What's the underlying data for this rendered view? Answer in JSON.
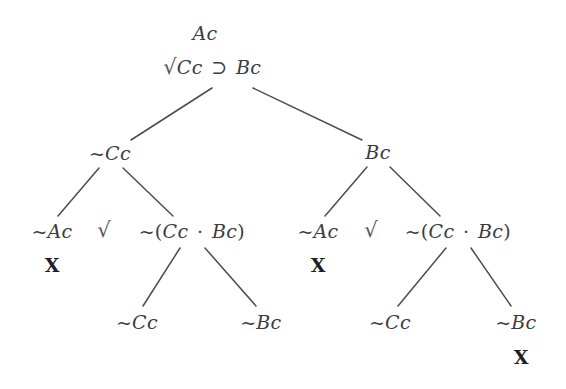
{
  "figure": {
    "kind": "truth-tree",
    "background_color": "#ffffff",
    "text_color": "#3a3c44",
    "line_color": "#4a4c54",
    "closure_color": "#1d1f26"
  },
  "nodes": [
    {
      "id": "premise",
      "text": "Ac",
      "x": 205,
      "y": 33
    },
    {
      "id": "conditional",
      "text": "Cc ⊃ Bc",
      "x": 219,
      "y": 67
    },
    {
      "id": "left-cc",
      "text": "~Cc",
      "x": 110,
      "y": 153
    },
    {
      "id": "right-bc",
      "text": "Bc",
      "x": 378,
      "y": 152
    },
    {
      "id": "l-not-ac",
      "text": "~Ac",
      "x": 52,
      "y": 231
    },
    {
      "id": "l-not-conj",
      "text": "~(Cc · Bc)",
      "x": 192,
      "y": 231
    },
    {
      "id": "r-not-ac",
      "text": "~Ac",
      "x": 318,
      "y": 231
    },
    {
      "id": "r-not-conj",
      "text": "~(Cc · Bc)",
      "x": 458,
      "y": 231
    },
    {
      "id": "l-leaf-cc",
      "text": "~Cc",
      "x": 137,
      "y": 322
    },
    {
      "id": "l-leaf-bc",
      "text": "~Bc",
      "x": 261,
      "y": 322
    },
    {
      "id": "r-leaf-cc",
      "text": "~Cc",
      "x": 390,
      "y": 322
    },
    {
      "id": "r-leaf-bc",
      "text": "~Bc",
      "x": 516,
      "y": 322
    }
  ],
  "checks": [
    {
      "id": "check-conditional",
      "glyph": "√",
      "x": 170,
      "y": 67
    },
    {
      "id": "check-left-conj",
      "glyph": "√",
      "x": 104,
      "y": 230
    },
    {
      "id": "check-right-conj",
      "glyph": "√",
      "x": 371,
      "y": 230
    }
  ],
  "closures": [
    {
      "id": "close-left-not-ac",
      "mark": "X",
      "x": 52,
      "y": 265
    },
    {
      "id": "close-right-not-ac",
      "mark": "X",
      "x": 318,
      "y": 265
    },
    {
      "id": "close-right-leaf-bc",
      "mark": "X",
      "x": 521,
      "y": 357
    }
  ],
  "edges": [
    {
      "id": "edge-root-left",
      "x1": 212,
      "y1": 88,
      "x2": 131,
      "y2": 140
    },
    {
      "id": "edge-root-right",
      "x1": 253,
      "y1": 88,
      "x2": 362,
      "y2": 140
    },
    {
      "id": "edge-left-to-notac",
      "x1": 99,
      "y1": 168,
      "x2": 58,
      "y2": 216
    },
    {
      "id": "edge-left-to-conj",
      "x1": 123,
      "y1": 168,
      "x2": 173,
      "y2": 216
    },
    {
      "id": "edge-right-to-notac",
      "x1": 367,
      "y1": 167,
      "x2": 325,
      "y2": 216
    },
    {
      "id": "edge-right-to-conj",
      "x1": 390,
      "y1": 167,
      "x2": 440,
      "y2": 216
    },
    {
      "id": "edge-lconj-to-cc",
      "x1": 180,
      "y1": 248,
      "x2": 143,
      "y2": 306
    },
    {
      "id": "edge-lconj-to-bc",
      "x1": 205,
      "y1": 248,
      "x2": 256,
      "y2": 306
    },
    {
      "id": "edge-rconj-to-cc",
      "x1": 446,
      "y1": 248,
      "x2": 398,
      "y2": 306
    },
    {
      "id": "edge-rconj-to-bc",
      "x1": 471,
      "y1": 248,
      "x2": 511,
      "y2": 306
    }
  ]
}
